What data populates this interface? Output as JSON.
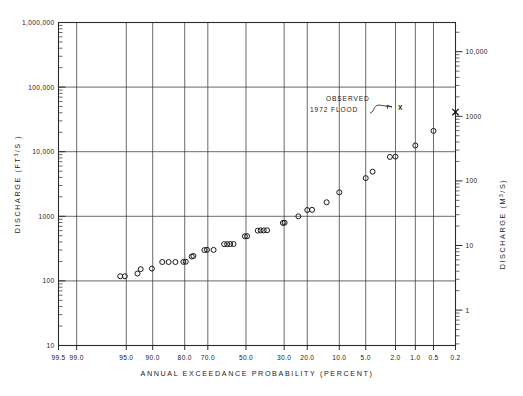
{
  "figure": {
    "name": "flood-frequency-plot",
    "background_color": "#ffffff",
    "ink_color": "#1a1a1a"
  },
  "annotation": {
    "line1": "OBSERVED",
    "line2": "1972  FLOOD",
    "marker_label": "X"
  },
  "chart_data": {
    "type": "scatter",
    "title": "",
    "xlabel": "ANNUAL   EXCEEDANCE   PROBABILITY   (PERCENT)",
    "ylabel": "DISCHARGE   (FT3/S)",
    "ylabel_secondary": "DISCHARGE   (M3/S)",
    "x_scale": "normal-probability (reversed, 99.5% left to 0.2% right)",
    "y_scale": "log10",
    "xlim": [
      99.5,
      0.2
    ],
    "ylim": [
      10,
      1000000
    ],
    "ylim_secondary": [
      0.283,
      28300
    ],
    "grid": true,
    "legend": "none",
    "x_tick_labels": [
      "99.5",
      "99.0",
      "95.0",
      "90.0",
      "80.0",
      "70.0",
      "50.0",
      "30.0",
      "20.0",
      "10.0",
      "5.0",
      "2.0",
      "1.0",
      "0.5",
      "0.2"
    ],
    "x_tick_values": [
      99.5,
      99.0,
      95.0,
      90.0,
      80.0,
      70.0,
      50.0,
      30.0,
      20.0,
      10.0,
      5.0,
      2.0,
      1.0,
      0.5,
      0.2
    ],
    "x_gridline_values": [
      99.0,
      95.0,
      90.0,
      80.0,
      70.0,
      50.0,
      30.0,
      20.0,
      10.0,
      5.0,
      2.0,
      1.0,
      0.5
    ],
    "y_tick_labels": [
      "1,000,000",
      "100,000",
      "10,000",
      "1000",
      "100",
      "10"
    ],
    "y_tick_values": [
      1000000,
      100000,
      10000,
      1000,
      100,
      10
    ],
    "y_gridline_values": [
      1000000,
      100000,
      10000,
      1000,
      100,
      10
    ],
    "y2_tick_labels": [
      "10,000",
      "1000",
      "100",
      "10",
      "1"
    ],
    "y2_tick_values": [
      10000,
      1000,
      100,
      10,
      1
    ],
    "series": [
      {
        "name": "Annual peak discharge (plotted points)",
        "marker": "open-circle",
        "points": [
          {
            "p": 93.2,
            "q": 130
          },
          {
            "p": 95.8,
            "q": 118
          },
          {
            "p": 95.2,
            "q": 118
          },
          {
            "p": 92.6,
            "q": 152
          },
          {
            "p": 90.2,
            "q": 155
          },
          {
            "p": 87.5,
            "q": 196
          },
          {
            "p": 85.6,
            "q": 196
          },
          {
            "p": 83.4,
            "q": 196
          },
          {
            "p": 80.5,
            "q": 197
          },
          {
            "p": 79.6,
            "q": 198
          },
          {
            "p": 77.2,
            "q": 238
          },
          {
            "p": 76.5,
            "q": 243
          },
          {
            "p": 71.6,
            "q": 300
          },
          {
            "p": 70.4,
            "q": 303
          },
          {
            "p": 67.2,
            "q": 302
          },
          {
            "p": 61.8,
            "q": 370
          },
          {
            "p": 60.2,
            "q": 370
          },
          {
            "p": 58.6,
            "q": 372
          },
          {
            "p": 56.8,
            "q": 372
          },
          {
            "p": 50.6,
            "q": 490
          },
          {
            "p": 49.4,
            "q": 492
          },
          {
            "p": 43.6,
            "q": 600
          },
          {
            "p": 42.0,
            "q": 605
          },
          {
            "p": 40.4,
            "q": 605
          },
          {
            "p": 38.6,
            "q": 608
          },
          {
            "p": 30.6,
            "q": 790
          },
          {
            "p": 29.8,
            "q": 795
          },
          {
            "p": 23.6,
            "q": 1000
          },
          {
            "p": 20.0,
            "q": 1250
          },
          {
            "p": 18.2,
            "q": 1260
          },
          {
            "p": 13.4,
            "q": 1650
          },
          {
            "p": 10.0,
            "q": 2350
          },
          {
            "p": 5.0,
            "q": 3900
          },
          {
            "p": 4.1,
            "q": 4900
          },
          {
            "p": 2.4,
            "q": 8300
          },
          {
            "p": 2.0,
            "q": 8400
          },
          {
            "p": 1.0,
            "q": 12500
          },
          {
            "p": 0.5,
            "q": 21000
          }
        ]
      },
      {
        "name": "Observed 1972 flood",
        "marker": "x",
        "points": [
          {
            "p": 0.2,
            "q": 41000
          }
        ]
      }
    ]
  }
}
